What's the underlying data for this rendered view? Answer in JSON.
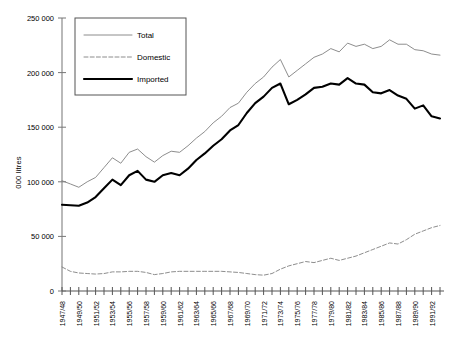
{
  "chart_data": {
    "type": "line",
    "title": "",
    "xlabel": "",
    "ylabel": "000 litres",
    "ylim": [
      0,
      250000
    ],
    "ytick_values": [
      0,
      50000,
      100000,
      150000,
      200000,
      250000
    ],
    "ytick_labels": [
      "0",
      "50 000",
      "100 000",
      "150 000",
      "200 000",
      "250 000"
    ],
    "grid": false,
    "legend_position": "upper-left-inside",
    "categories": [
      "1947/48",
      "1948/49",
      "1949/50",
      "1950/51",
      "1951/52",
      "1952/53",
      "1953/54",
      "1954/55",
      "1955/56",
      "1956/57",
      "1957/58",
      "1958/59",
      "1959/60",
      "1960/61",
      "1961/62",
      "1962/63",
      "1963/64",
      "1964/65",
      "1965/66",
      "1966/67",
      "1967/68",
      "1968/69",
      "1969/70",
      "1970/71",
      "1971/72",
      "1972/73",
      "1973/74",
      "1974/75",
      "1975/76",
      "1976/77",
      "1977/78",
      "1978/79",
      "1979/80",
      "1980/81",
      "1981/82",
      "1982/83",
      "1983/84",
      "1984/85",
      "1985/86",
      "1986/87",
      "1987/88",
      "1988/89",
      "1989/90",
      "1990/91",
      "1991/92",
      "1992/93"
    ],
    "xtick_labels_shown": [
      "1947/48",
      "1949/50",
      "1951/52",
      "1953/54",
      "1955/56",
      "1957/58",
      "1959/60",
      "1961/62",
      "1963/64",
      "1965/66",
      "1967/68",
      "1969/70",
      "1971/72",
      "1973/74",
      "1975/76",
      "1977/78",
      "1979/80",
      "1981/82",
      "1983/84",
      "1985/86",
      "1987/88",
      "1989/90",
      "1991/92"
    ],
    "series": [
      {
        "name": "Total",
        "style": "thin-solid",
        "color": "#808080",
        "values": [
          101000,
          98000,
          95000,
          100000,
          104000,
          113000,
          122000,
          117000,
          127000,
          130000,
          123000,
          118000,
          124000,
          128000,
          127000,
          133000,
          140000,
          146000,
          154000,
          160000,
          168000,
          172000,
          182000,
          190000,
          196000,
          205000,
          212000,
          196000,
          202000,
          208000,
          214000,
          217000,
          222000,
          219000,
          227000,
          224000,
          226000,
          222000,
          224000,
          230000,
          226000,
          226000,
          221000,
          220000,
          217000,
          216000
        ]
      },
      {
        "name": "Domestic",
        "style": "dashed",
        "color": "#808080",
        "values": [
          22000,
          18000,
          16500,
          16000,
          15500,
          16000,
          17500,
          17500,
          18000,
          18000,
          17000,
          15000,
          16000,
          17500,
          18000,
          18000,
          18000,
          18000,
          18000,
          18000,
          17500,
          17000,
          16000,
          15000,
          14500,
          16000,
          20000,
          23000,
          25000,
          27000,
          26000,
          28000,
          30000,
          28000,
          30000,
          32000,
          35000,
          38000,
          41000,
          44000,
          43000,
          47000,
          52000,
          55000,
          58000,
          60000
        ]
      },
      {
        "name": "Imported",
        "style": "thick-solid",
        "color": "#000000",
        "values": [
          79000,
          78500,
          78000,
          81000,
          86000,
          94000,
          102000,
          97000,
          106000,
          110000,
          102000,
          100000,
          106000,
          108000,
          106000,
          112000,
          120000,
          126000,
          133000,
          139000,
          147000,
          152000,
          163000,
          172000,
          178000,
          186000,
          190000,
          171000,
          175000,
          180000,
          186000,
          187000,
          190000,
          189000,
          195000,
          190000,
          189000,
          182000,
          181000,
          184000,
          179000,
          176000,
          167000,
          170000,
          160000,
          158000
        ]
      }
    ]
  },
  "legend": {
    "items": [
      {
        "label": "Total"
      },
      {
        "label": "Domestic"
      },
      {
        "label": "Imported"
      }
    ]
  }
}
